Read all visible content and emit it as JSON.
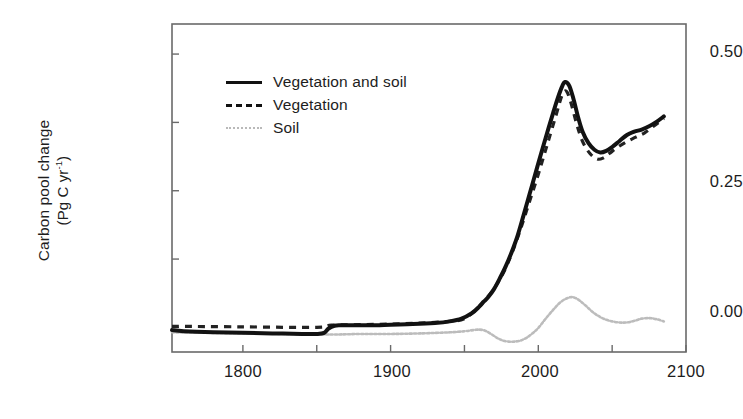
{
  "chart_data": {
    "type": "line",
    "title": "",
    "xlabel": "",
    "ylabel": "Carbon pool change (Pg C yr-1)",
    "ylabel_line1": "Carbon pool change",
    "ylabel_line2_prefix": "(Pg C yr",
    "ylabel_line2_sup": "-1",
    "ylabel_line2_suffix": ")",
    "xlim": [
      1752,
      2100
    ],
    "ylim": [
      -0.045,
      0.555
    ],
    "grid": false,
    "legend_position": "upper-left-inside",
    "xticks": [
      1800,
      1850,
      1900,
      1950,
      2000,
      2050,
      2100
    ],
    "xtick_labels": [
      "1800",
      "",
      "1900",
      "",
      "2000",
      "",
      "2100"
    ],
    "xtick_labels_major": [
      "1800",
      "1900",
      "2000",
      "2100"
    ],
    "yticks": [
      0.0,
      0.125,
      0.25,
      0.375,
      0.5
    ],
    "ytick_labels_major": [
      "0.00",
      "0.25",
      "0.50"
    ],
    "colors": {
      "vegetation_and_soil": "#121212",
      "vegetation": "#222222",
      "soil": "#bcbcbc",
      "axis": "#5a5a5a",
      "text": "#1d1d1d",
      "background": "#ffffff"
    },
    "series": [
      {
        "name": "Vegetation and soil",
        "style": "solid",
        "color": "#121212",
        "x": [
          1752,
          1760,
          1780,
          1800,
          1820,
          1840,
          1850,
          1855,
          1858,
          1862,
          1866,
          1875,
          1890,
          1900,
          1915,
          1930,
          1940,
          1948,
          1955,
          1960,
          1963,
          1966,
          1970,
          1974,
          1978,
          1982,
          1986,
          1990,
          1994,
          1998,
          2002,
          2006,
          2010,
          2013,
          2016,
          2018,
          2021,
          2024,
          2027,
          2030,
          2034,
          2038,
          2042,
          2046,
          2050,
          2055,
          2060,
          2065,
          2070,
          2075,
          2080,
          2085
        ],
        "y": [
          -0.005,
          -0.007,
          -0.009,
          -0.01,
          -0.011,
          -0.012,
          -0.012,
          -0.01,
          -0.002,
          0.003,
          0.004,
          0.004,
          0.004,
          0.005,
          0.006,
          0.008,
          0.011,
          0.016,
          0.026,
          0.038,
          0.047,
          0.055,
          0.07,
          0.09,
          0.112,
          0.138,
          0.168,
          0.205,
          0.243,
          0.281,
          0.319,
          0.356,
          0.392,
          0.418,
          0.44,
          0.449,
          0.442,
          0.416,
          0.384,
          0.358,
          0.337,
          0.325,
          0.32,
          0.323,
          0.33,
          0.341,
          0.352,
          0.358,
          0.362,
          0.368,
          0.376,
          0.386
        ]
      },
      {
        "name": "Vegetation",
        "style": "dashed",
        "color": "#222222",
        "x": [
          1752,
          1800,
          1850,
          1860,
          1880,
          1900,
          1920,
          1940,
          1950,
          1958,
          1964,
          1970,
          1976,
          1982,
          1988,
          1994,
          2000,
          2006,
          2012,
          2016,
          2019,
          2022,
          2026,
          2030,
          2035,
          2040,
          2044,
          2048,
          2054,
          2060,
          2066,
          2072,
          2078,
          2085
        ],
        "y": [
          0.002,
          0.001,
          0.0,
          0.004,
          0.005,
          0.006,
          0.008,
          0.011,
          0.016,
          0.033,
          0.05,
          0.071,
          0.098,
          0.135,
          0.18,
          0.23,
          0.28,
          0.334,
          0.388,
          0.424,
          0.432,
          0.412,
          0.372,
          0.34,
          0.318,
          0.308,
          0.31,
          0.318,
          0.33,
          0.34,
          0.348,
          0.356,
          0.368,
          0.382
        ]
      },
      {
        "name": "Soil",
        "style": "dotted",
        "color": "#bcbcbc",
        "x": [
          1752,
          1780,
          1800,
          1830,
          1860,
          1880,
          1900,
          1920,
          1940,
          1950,
          1956,
          1960,
          1964,
          1968,
          1972,
          1976,
          1980,
          1984,
          1988,
          1992,
          1996,
          2000,
          2005,
          2010,
          2015,
          2020,
          2024,
          2028,
          2032,
          2036,
          2040,
          2045,
          2050,
          2055,
          2060,
          2065,
          2070,
          2075,
          2080,
          2085
        ],
        "y": [
          -0.009,
          -0.01,
          -0.011,
          -0.012,
          -0.013,
          -0.012,
          -0.012,
          -0.011,
          -0.009,
          -0.007,
          -0.005,
          -0.004,
          -0.006,
          -0.012,
          -0.019,
          -0.024,
          -0.026,
          -0.026,
          -0.024,
          -0.019,
          -0.011,
          -0.001,
          0.016,
          0.032,
          0.046,
          0.054,
          0.055,
          0.049,
          0.04,
          0.03,
          0.022,
          0.015,
          0.011,
          0.009,
          0.009,
          0.012,
          0.016,
          0.017,
          0.015,
          0.011
        ]
      }
    ],
    "annotations": []
  },
  "axes": {
    "ytick_050": "0.50",
    "ytick_025": "0.25",
    "ytick_000": "0.00",
    "xtick_1800": "1800",
    "xtick_1900": "1900",
    "xtick_2000": "2000",
    "xtick_2100": "2100"
  },
  "legend": {
    "items": [
      {
        "label": "Vegetation and soil",
        "style": "solid"
      },
      {
        "label": "Vegetation",
        "style": "dashed"
      },
      {
        "label": "Soil",
        "style": "dotted"
      }
    ]
  }
}
